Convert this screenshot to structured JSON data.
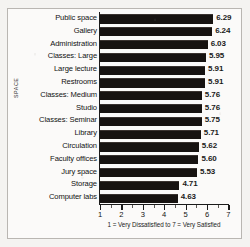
{
  "chart_data": {
    "type": "bar",
    "orientation": "horizontal",
    "title": "",
    "xlabel": "1 = Very Dissatisfied to 7 = Very Satisfied",
    "ylabel": "SPACE",
    "xlim": [
      1,
      7
    ],
    "xticks": [
      1,
      2,
      3,
      4,
      5,
      6,
      7
    ],
    "xticklabels": [
      "1",
      "2",
      "3",
      "4",
      "5",
      "6",
      "7"
    ],
    "minor_ticks": [
      1.5,
      2.5,
      3.5,
      4.5,
      5.5,
      6.5
    ],
    "grid": false,
    "legend": null,
    "bar_color": "#171311",
    "categories": [
      "Public space",
      "Gallery",
      "Administration",
      "Classes: Large",
      "Large lecture",
      "Restrooms",
      "Classes: Medium",
      "Studio",
      "Classes: Seminar",
      "Library",
      "Circulation",
      "Faculty offices",
      "Jury space",
      "Storage",
      "Computer labs"
    ],
    "values": [
      6.29,
      6.24,
      6.03,
      5.95,
      5.91,
      5.91,
      5.76,
      5.76,
      5.75,
      5.71,
      5.62,
      5.6,
      5.53,
      4.71,
      4.63
    ],
    "value_labels": [
      "6.29",
      "6.24",
      "6.03",
      "5.95",
      "5.91",
      "5.91",
      "5.76",
      "5.76",
      "5.75",
      "5.71",
      "5.62",
      "5.60",
      "5.53",
      "4.71",
      "4.63"
    ]
  }
}
